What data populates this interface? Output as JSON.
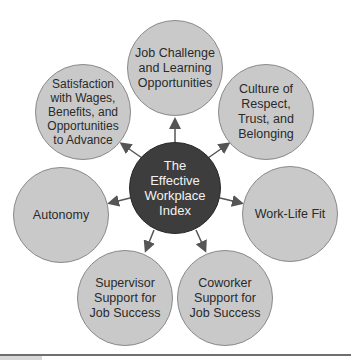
{
  "diagram": {
    "title": "The Effective Workplace Index",
    "center": {
      "label": "The\nEffective\nWorkplace\nIndex",
      "fill": "#3d3d3d",
      "text_color": "#f2f2f2"
    },
    "node_fill": "#c9c9c9",
    "arrow_color": "#555555",
    "nodes": [
      {
        "id": "job-challenge",
        "label": "Job Challenge\nand Learning\nOpportunities"
      },
      {
        "id": "culture",
        "label": "Culture of\nRespect,\nTrust, and\nBelonging"
      },
      {
        "id": "work-life",
        "label": "Work-Life Fit"
      },
      {
        "id": "coworker",
        "label": "Coworker\nSupport for\nJob Success"
      },
      {
        "id": "supervisor",
        "label": "Supervisor\nSupport for\nJob Success"
      },
      {
        "id": "autonomy",
        "label": "Autonomy"
      },
      {
        "id": "satisfaction",
        "label": "Satisfaction\nwith Wages,\nBenefits, and\nOpportunities\nto Advance"
      }
    ]
  }
}
